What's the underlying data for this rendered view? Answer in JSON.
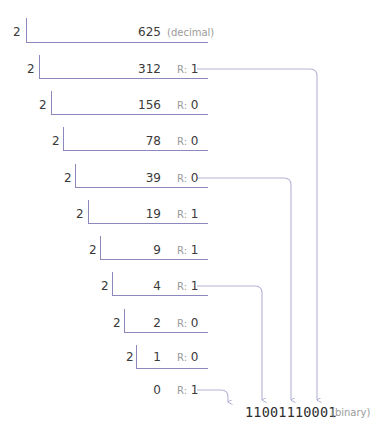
{
  "diagram": {
    "decimal_note": "(decimal)",
    "binary_note": "(binary)",
    "remainder_label": "R:",
    "colors": {
      "line": "#8a88bd",
      "arrow": "#b4b3d6",
      "text": "#3a3a3a",
      "muted": "#9a9a9a"
    },
    "steps": [
      {
        "divisor": "2",
        "quotient": "625",
        "remainder": ""
      },
      {
        "divisor": "2",
        "quotient": "312",
        "remainder": "1"
      },
      {
        "divisor": "2",
        "quotient": "156",
        "remainder": "0"
      },
      {
        "divisor": "2",
        "quotient": "78",
        "remainder": "0"
      },
      {
        "divisor": "2",
        "quotient": "39",
        "remainder": "0"
      },
      {
        "divisor": "2",
        "quotient": "19",
        "remainder": "1"
      },
      {
        "divisor": "2",
        "quotient": "9",
        "remainder": "1"
      },
      {
        "divisor": "2",
        "quotient": "4",
        "remainder": "1"
      },
      {
        "divisor": "2",
        "quotient": "2",
        "remainder": "0"
      },
      {
        "divisor": "2",
        "quotient": "1",
        "remainder": "0"
      },
      {
        "divisor": "",
        "quotient": "0",
        "remainder": "1"
      }
    ],
    "binary_result": "1100111000 1",
    "binary_result_clean": "11001110001"
  }
}
